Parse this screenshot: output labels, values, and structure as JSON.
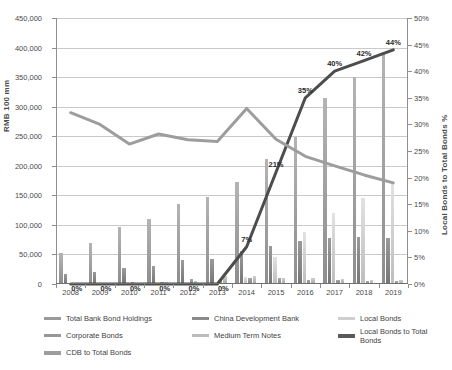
{
  "chart_data": {
    "type": "bar",
    "title": "",
    "xlabel": "",
    "ylabel": "RMB 100 mm",
    "y2label": "Local Bonds to Total Bonds %",
    "categories": [
      "2008",
      "2009",
      "2010",
      "2011",
      "2012",
      "2013",
      "2014",
      "2015",
      "2016",
      "2017",
      "2018",
      "2019"
    ],
    "ylim": [
      0,
      450000
    ],
    "y2lim": [
      0,
      0.5
    ],
    "grid": true,
    "legend_position": "bottom",
    "y_ticks": [
      "0",
      "50,000",
      "100,000",
      "150,000",
      "200,000",
      "250,000",
      "300,000",
      "350,000",
      "400,000",
      "450,000"
    ],
    "y2_ticks": [
      "0%",
      "5%",
      "10%",
      "15%",
      "20%",
      "25%",
      "30%",
      "35%",
      "40%",
      "45%",
      "50%"
    ],
    "series": [
      {
        "name": "Total Bank Bond Holdings",
        "axis": "left",
        "kind": "bar",
        "color": "#9a9a9a",
        "values": [
          53000,
          70000,
          97000,
          110000,
          136000,
          148000,
          172000,
          212000,
          249000,
          315000,
          350000,
          393000
        ]
      },
      {
        "name": "China Development Bank",
        "axis": "left",
        "kind": "bar",
        "color": "#8a8a8a",
        "values": [
          17000,
          21000,
          27000,
          31000,
          40000,
          42000,
          56000,
          64000,
          72000,
          78000,
          79000,
          78000
        ]
      },
      {
        "name": "Local Bonds",
        "axis": "left",
        "kind": "bar",
        "color": "#cfcfcf",
        "values": [
          0,
          0,
          0,
          0,
          0,
          1000,
          12000,
          45000,
          88000,
          120000,
          146000,
          172000
        ]
      },
      {
        "name": "Corporate Bonds",
        "axis": "left",
        "kind": "bar",
        "color": "#979797",
        "values": [
          1500,
          2000,
          3000,
          3500,
          8500,
          9000,
          9500,
          10000,
          7000,
          6000,
          5500,
          5000
        ]
      },
      {
        "name": "Medium Term Notes",
        "axis": "left",
        "kind": "bar",
        "color": "#bcbcbc",
        "values": [
          500,
          1500,
          2500,
          3000,
          5500,
          13000,
          14000,
          11000,
          9500,
          8500,
          7500,
          7000
        ]
      },
      {
        "name": "Local Bonds to Total Bonds",
        "axis": "right",
        "kind": "line",
        "color": "#4d4d4d",
        "width": 3,
        "values": [
          0.0,
          0.0,
          0.0,
          0.0,
          0.0,
          0.0,
          0.07,
          0.21,
          0.35,
          0.4,
          0.42,
          0.44
        ],
        "labels": [
          "0%",
          "0%",
          "0%",
          "0%",
          "0%",
          "0%",
          "7%",
          "21%",
          "35%",
          "40%",
          "42%",
          "44%"
        ]
      },
      {
        "name": "CDB to Total Bonds",
        "axis": "right",
        "kind": "line",
        "color": "#9d9d9d",
        "width": 3,
        "values": [
          0.322,
          0.3,
          0.263,
          0.282,
          0.271,
          0.268,
          0.33,
          0.272,
          0.24,
          0.222,
          0.205,
          0.19
        ],
        "labels": [
          "",
          "",
          "",
          "",
          "",
          "",
          "",
          "",
          "",
          "",
          "",
          ""
        ]
      }
    ],
    "legend_entries": [
      "Total Bank Bond Holdings",
      "China Development Bank",
      "Local Bonds",
      "Corporate Bonds",
      "Medium Term Notes",
      "Local Bonds to Total Bonds",
      "CDB to Total Bonds"
    ]
  }
}
